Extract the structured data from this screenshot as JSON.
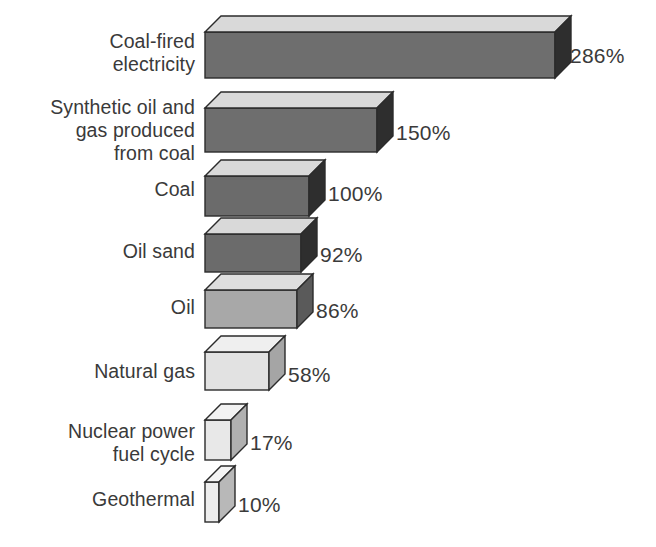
{
  "chart_data": {
    "type": "bar",
    "orientation": "horizontal",
    "style": "3d-isometric-blocks",
    "title": "",
    "subtitle": "",
    "xlabel": "",
    "ylabel": "",
    "unit": "%",
    "baseline_category": "Coal",
    "baseline_value": 100,
    "xlim": [
      0,
      286
    ],
    "grid": false,
    "legend": null,
    "categories": [
      "Coal-fired\nelectricity",
      "Synthetic oil and\ngas produced\nfrom coal",
      "Coal",
      "Oil sand",
      "Oil",
      "Natural gas",
      "Nuclear power\nfuel cycle",
      "Geothermal"
    ],
    "values": [
      286,
      150,
      100,
      92,
      86,
      58,
      17,
      10
    ],
    "value_labels": [
      "286%",
      "150%",
      "100%",
      "92%",
      "86%",
      "58%",
      "17%",
      "10%"
    ]
  },
  "bars": [
    {
      "label": "Coal-fired\nelectricity",
      "value": 286,
      "value_label": "286%",
      "x": 205,
      "y": 32,
      "w": 350,
      "h": 46,
      "depth": 16,
      "front": "#6e6e6e",
      "top": "#d9d9d9",
      "side": "#2e2e2e",
      "label_x": 25,
      "label_y": 30,
      "label_w": 170,
      "value_x": 570,
      "value_y": 45
    },
    {
      "label": "Synthetic oil and\ngas produced\nfrom coal",
      "value": 150,
      "value_label": "150%",
      "x": 205,
      "y": 108,
      "w": 172,
      "h": 44,
      "depth": 16,
      "front": "#6e6e6e",
      "top": "#d9d9d9",
      "side": "#2e2e2e",
      "label_x": 10,
      "label_y": 96,
      "label_w": 185,
      "value_x": 396,
      "value_y": 122
    },
    {
      "label": "Coal",
      "value": 100,
      "value_label": "100%",
      "x": 205,
      "y": 176,
      "w": 104,
      "h": 40,
      "depth": 16,
      "front": "#6b6b6b",
      "top": "#d9d9d9",
      "side": "#2e2e2e",
      "label_x": 25,
      "label_y": 178,
      "label_w": 170,
      "value_x": 328,
      "value_y": 183
    },
    {
      "label": "Oil sand",
      "value": 92,
      "value_label": "92%",
      "x": 205,
      "y": 234,
      "w": 96,
      "h": 38,
      "depth": 16,
      "front": "#6b6b6b",
      "top": "#d9d9d9",
      "side": "#2e2e2e",
      "label_x": 25,
      "label_y": 240,
      "label_w": 170,
      "value_x": 320,
      "value_y": 244
    },
    {
      "label": "Oil",
      "value": 86,
      "value_label": "86%",
      "x": 205,
      "y": 290,
      "w": 92,
      "h": 38,
      "depth": 16,
      "front": "#a8a8a8",
      "top": "#dedede",
      "side": "#5a5a5a",
      "label_x": 25,
      "label_y": 296,
      "label_w": 170,
      "value_x": 316,
      "value_y": 300
    },
    {
      "label": "Natural gas",
      "value": 58,
      "value_label": "58%",
      "x": 205,
      "y": 352,
      "w": 64,
      "h": 38,
      "depth": 16,
      "front": "#e2e2e2",
      "top": "#efefef",
      "side": "#a5a5a5",
      "label_x": 25,
      "label_y": 360,
      "label_w": 170,
      "value_x": 288,
      "value_y": 364
    },
    {
      "label": "Nuclear power\nfuel cycle",
      "value": 17,
      "value_label": "17%",
      "x": 205,
      "y": 420,
      "w": 26,
      "h": 40,
      "depth": 16,
      "front": "#e8e8e8",
      "top": "#f2f2f2",
      "side": "#b0b0b0",
      "label_x": 25,
      "label_y": 420,
      "label_w": 170,
      "value_x": 250,
      "value_y": 432
    },
    {
      "label": "Geothermal",
      "value": 10,
      "value_label": "10%",
      "x": 205,
      "y": 482,
      "w": 14,
      "h": 40,
      "depth": 16,
      "front": "#eeeeee",
      "top": "#f5f5f5",
      "side": "#b8b8b8",
      "label_x": 25,
      "label_y": 488,
      "label_w": 170,
      "value_x": 238,
      "value_y": 494
    }
  ],
  "colors": {
    "background": "#ffffff",
    "text": "#3a3a3a",
    "outline": "#2b2b2b",
    "bar_dark_front": "#6e6e6e",
    "bar_mid_front": "#a8a8a8",
    "bar_light_front": "#e8e8e8",
    "bar_top": "#d9d9d9",
    "bar_side_dark": "#2e2e2e"
  }
}
